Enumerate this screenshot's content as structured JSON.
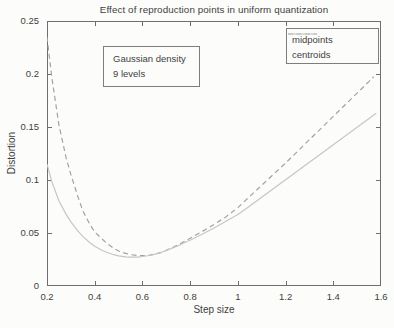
{
  "figure": {
    "background": "#fcfcfa",
    "text_color": "#3f3f3f",
    "axis_color": "#6f6f6f"
  },
  "annotation": {
    "line1": "Gaussian density",
    "line2": "9 levels"
  },
  "chart_data": {
    "type": "line",
    "title": "Effect of reproduction points in uniform quantization",
    "xlabel": "Step size",
    "ylabel": "Distortion",
    "xlim": [
      0.2,
      1.6
    ],
    "ylim": [
      0,
      0.25
    ],
    "grid": false,
    "legend_position": "top-right",
    "xtick_values": [
      0.2,
      0.4,
      0.6,
      0.8,
      1,
      1.2,
      1.4,
      1.6
    ],
    "xtick_labels": [
      "0.2",
      "0.4",
      "0.6",
      "0.8",
      "1",
      "1.2",
      "1.4",
      "1.6"
    ],
    "ytick_values": [
      0,
      0.05,
      0.1,
      0.15,
      0.2,
      0.25
    ],
    "ytick_labels": [
      "0",
      "0.05",
      "0.1",
      "0.15",
      "0.2",
      "0.25"
    ],
    "series": [
      {
        "name": "midpoints",
        "line_style": "dashed",
        "color": "#a2a2a2",
        "points": [
          [
            0.2,
            0.235
          ],
          [
            0.22,
            0.197
          ],
          [
            0.25,
            0.152
          ],
          [
            0.28,
            0.121
          ],
          [
            0.3,
            0.105
          ],
          [
            0.33,
            0.084
          ],
          [
            0.35,
            0.071
          ],
          [
            0.38,
            0.058
          ],
          [
            0.4,
            0.051
          ],
          [
            0.43,
            0.0445
          ],
          [
            0.45,
            0.0405
          ],
          [
            0.48,
            0.0355
          ],
          [
            0.5,
            0.033
          ],
          [
            0.53,
            0.0308
          ],
          [
            0.55,
            0.0296
          ],
          [
            0.58,
            0.0288
          ],
          [
            0.6,
            0.0286
          ],
          [
            0.63,
            0.0291
          ],
          [
            0.65,
            0.03
          ],
          [
            0.68,
            0.0317
          ],
          [
            0.7,
            0.0337
          ],
          [
            0.73,
            0.0368
          ],
          [
            0.75,
            0.039
          ],
          [
            0.78,
            0.0425
          ],
          [
            0.8,
            0.045
          ],
          [
            0.85,
            0.0513
          ],
          [
            0.9,
            0.058
          ],
          [
            0.95,
            0.0652
          ],
          [
            1.0,
            0.074
          ],
          [
            1.05,
            0.0845
          ],
          [
            1.1,
            0.095
          ],
          [
            1.15,
            0.1055
          ],
          [
            1.2,
            0.116
          ],
          [
            1.25,
            0.127
          ],
          [
            1.3,
            0.138
          ],
          [
            1.35,
            0.149
          ],
          [
            1.4,
            0.16
          ],
          [
            1.45,
            0.171
          ],
          [
            1.5,
            0.182
          ],
          [
            1.55,
            0.193
          ],
          [
            1.57,
            0.1975
          ]
        ]
      },
      {
        "name": "centroids",
        "line_style": "solid",
        "color": "#c6c6c6",
        "points": [
          [
            0.2,
            0.115
          ],
          [
            0.22,
            0.0985
          ],
          [
            0.25,
            0.0805
          ],
          [
            0.28,
            0.0675
          ],
          [
            0.3,
            0.0605
          ],
          [
            0.33,
            0.0518
          ],
          [
            0.35,
            0.0468
          ],
          [
            0.38,
            0.0408
          ],
          [
            0.4,
            0.0375
          ],
          [
            0.43,
            0.0338
          ],
          [
            0.45,
            0.0318
          ],
          [
            0.48,
            0.0295
          ],
          [
            0.5,
            0.0285
          ],
          [
            0.53,
            0.0275
          ],
          [
            0.55,
            0.0272
          ],
          [
            0.58,
            0.0273
          ],
          [
            0.6,
            0.0278
          ],
          [
            0.63,
            0.0288
          ],
          [
            0.65,
            0.0298
          ],
          [
            0.68,
            0.0318
          ],
          [
            0.7,
            0.0335
          ],
          [
            0.73,
            0.0362
          ],
          [
            0.75,
            0.038
          ],
          [
            0.78,
            0.0412
          ],
          [
            0.8,
            0.0432
          ],
          [
            0.85,
            0.0488
          ],
          [
            0.9,
            0.0547
          ],
          [
            0.95,
            0.061
          ],
          [
            1.0,
            0.0675
          ],
          [
            1.05,
            0.0755
          ],
          [
            1.1,
            0.0838
          ],
          [
            1.15,
            0.092
          ],
          [
            1.2,
            0.1003
          ],
          [
            1.25,
            0.1085
          ],
          [
            1.3,
            0.1168
          ],
          [
            1.35,
            0.125
          ],
          [
            1.4,
            0.1333
          ],
          [
            1.45,
            0.1415
          ],
          [
            1.5,
            0.1498
          ],
          [
            1.55,
            0.158
          ],
          [
            1.58,
            0.163
          ]
        ]
      }
    ]
  }
}
